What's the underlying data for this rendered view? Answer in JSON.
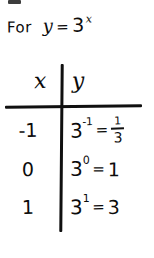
{
  "page": {
    "background_color": "#ffffff",
    "ink_color": "#0b0b0b",
    "stray_mark_top": "",
    "style": "handwritten-math-note"
  },
  "title": {
    "word": "For",
    "variable": "y",
    "equals": "=",
    "base": "3",
    "exponent": "x",
    "full_text": "For y = 3^x"
  },
  "table": {
    "headers": {
      "x": "x",
      "y": "y"
    },
    "rows": [
      {
        "x": "-1",
        "y_base": "3",
        "y_exponent": "-1",
        "y_equals": "=",
        "y_value_type": "fraction",
        "y_numerator": "1",
        "y_denominator": "3",
        "y_value": "1/3",
        "y_full": "3^-1 = 1/3"
      },
      {
        "x": "0",
        "y_base": "3",
        "y_exponent": "0",
        "y_equals": "=",
        "y_value_type": "integer",
        "y_value": "1",
        "y_full": "3^0 = 1"
      },
      {
        "x": "1",
        "y_base": "3",
        "y_exponent": "1",
        "y_equals": "=",
        "y_value_type": "integer",
        "y_value": "3",
        "y_full": "3^1 = 3"
      }
    ]
  },
  "chart_data": {
    "type": "table",
    "columns": [
      "x",
      "y"
    ],
    "categories": [
      "-1",
      "0",
      "1"
    ],
    "x": [
      -1,
      0,
      1
    ],
    "values": [
      0.3333333333,
      1,
      3
    ],
    "value_labels": [
      "3^-1 = 1/3",
      "3^0 = 1",
      "3^1 = 3"
    ],
    "xlabel": "x",
    "ylabel": "y",
    "function": "y = 3^x",
    "grid": false,
    "legend": "none"
  }
}
